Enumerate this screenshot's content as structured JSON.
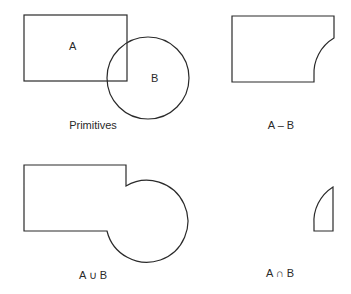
{
  "diagram": {
    "type": "boolean-operations-on-solids",
    "stroke_color": "#2a2a2a",
    "background": "#ffffff",
    "panels": [
      {
        "id": "primitives",
        "caption": "Primitives",
        "shapes": [
          {
            "name": "A",
            "kind": "rectangle",
            "label": "A"
          },
          {
            "name": "B",
            "kind": "circle",
            "label": "B"
          }
        ]
      },
      {
        "id": "difference",
        "caption": "A – B"
      },
      {
        "id": "union",
        "caption": "A ∪ B"
      },
      {
        "id": "intersection",
        "caption": "A ∩ B"
      }
    ]
  }
}
